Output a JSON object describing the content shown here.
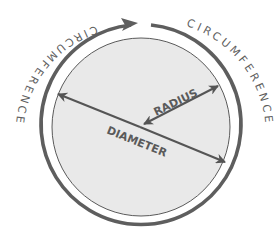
{
  "diagram": {
    "labels": {
      "radius": "RADIUS",
      "diameter": "DIAMETER",
      "circumference_left": "CIRCUMFERENCE",
      "circumference_right": "CIRCUMFERENCE"
    },
    "colors": {
      "circle_fill": "#e8e8e8",
      "circle_stroke": "#5a5a5a",
      "ring_stroke": "#5e5e5e",
      "arrow": "#555555",
      "text": "#5a5a5a",
      "background": "#ffffff"
    }
  }
}
